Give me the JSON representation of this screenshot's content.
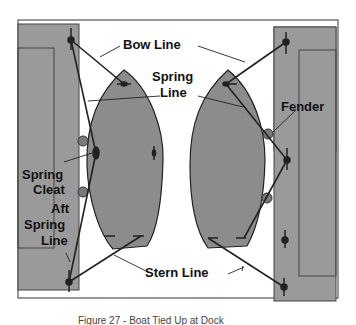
{
  "diagram": {
    "labels": {
      "bow_line": "Bow Line",
      "spring_line_1": "Spring",
      "spring_line_2": "Line",
      "fender": "Fender",
      "spring_cleat_1": "Spring",
      "spring_cleat_2": "Cleat",
      "aft_spring_1": "Aft",
      "aft_spring_2": "Spring",
      "aft_spring_3": "Line",
      "stern_line": "Stern Line"
    },
    "caption": "Figure 27 - Boat Tied Up at Dock"
  },
  "colors": {
    "dock_fill": "#9a9a9a",
    "boat_fill": "#8c8c8c",
    "line": "#222222",
    "frame": "#555555",
    "fender": "#7a7a7a"
  }
}
